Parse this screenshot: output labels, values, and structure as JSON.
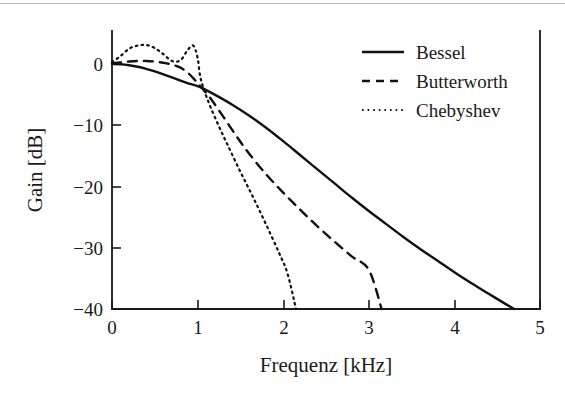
{
  "figure": {
    "background_color": "#ffffff",
    "ink_color": "#111111",
    "top_rule_color": "#b9b9b9",
    "has_top_rule": true
  },
  "chart_data": {
    "type": "line",
    "title": "",
    "subtitle": "",
    "xlabel": "Frequenz [kHz]",
    "ylabel": "Gain [dB]",
    "xlim": [
      0,
      5
    ],
    "ylim": [
      -40,
      5
    ],
    "xticks": [
      0,
      1,
      2,
      3,
      4,
      5
    ],
    "xtick_labels": [
      "0",
      "1",
      "2",
      "3",
      "4",
      "5"
    ],
    "yticks": [
      0,
      -10,
      -20,
      -30,
      -40
    ],
    "ytick_labels": [
      "0",
      "−10",
      "−20",
      "−30",
      "−40"
    ],
    "grid": false,
    "legend_position": "top-right",
    "legend_entries": [
      "Bessel",
      "Butterworth",
      "Chebyshev"
    ],
    "series": [
      {
        "name": "Bessel",
        "style": "solid",
        "x": [
          0.0,
          0.1,
          0.2,
          0.3,
          0.4,
          0.5,
          0.6,
          0.7,
          0.8,
          0.9,
          1.0,
          1.05,
          1.2,
          1.4,
          1.6,
          1.8,
          2.0,
          2.2,
          2.4,
          2.6,
          2.8,
          3.0,
          3.2,
          3.4,
          3.6,
          3.8,
          4.0,
          4.2,
          4.4,
          4.6,
          4.7
        ],
        "y": [
          0.0,
          -0.05,
          -0.2,
          -0.45,
          -0.8,
          -1.2,
          -1.7,
          -2.2,
          -2.7,
          -3.2,
          -3.6,
          -3.9,
          -5.0,
          -6.6,
          -8.4,
          -10.4,
          -12.6,
          -14.9,
          -17.2,
          -19.5,
          -21.8,
          -24.0,
          -26.1,
          -28.2,
          -30.2,
          -32.1,
          -34.0,
          -35.8,
          -37.5,
          -39.2,
          -40.0
        ]
      },
      {
        "name": "Butterworth",
        "style": "dashed",
        "x": [
          0.0,
          0.1,
          0.2,
          0.3,
          0.4,
          0.5,
          0.6,
          0.7,
          0.8,
          0.9,
          1.0,
          1.05,
          1.15,
          1.3,
          1.45,
          1.6,
          1.8,
          2.0,
          2.2,
          2.4,
          2.6,
          2.8,
          3.0,
          3.15
        ],
        "y": [
          0.1,
          0.25,
          0.4,
          0.5,
          0.5,
          0.4,
          0.2,
          -0.1,
          -0.6,
          -1.6,
          -3.1,
          -3.9,
          -5.6,
          -8.6,
          -11.7,
          -14.6,
          -18.0,
          -21.0,
          -23.8,
          -26.5,
          -29.0,
          -31.4,
          -33.6,
          -40.0
        ]
      },
      {
        "name": "Chebyshev",
        "style": "dotted",
        "x": [
          0.0,
          0.1,
          0.2,
          0.3,
          0.4,
          0.5,
          0.6,
          0.7,
          0.8,
          0.88,
          0.95,
          1.0,
          1.03,
          1.08,
          1.15,
          1.25,
          1.35,
          1.5,
          1.65,
          1.8,
          1.95,
          2.05,
          2.15
        ],
        "y": [
          0.3,
          1.3,
          2.5,
          3.0,
          3.1,
          2.6,
          1.6,
          0.5,
          0.6,
          2.2,
          3.0,
          1.0,
          -2.0,
          -4.4,
          -7.0,
          -10.2,
          -13.2,
          -17.6,
          -21.8,
          -26.2,
          -30.8,
          -34.2,
          -40.0
        ]
      }
    ],
    "annotations": [],
    "notes": {
      "crossing_point": {
        "x": 1.03,
        "y": -3.6,
        "description": "all three curves intersect near 1 kHz at about -3.6 dB"
      },
      "minus40_crossings": {
        "Chebyshev": 2.15,
        "Butterworth": 3.15,
        "Bessel": 4.7
      }
    }
  }
}
